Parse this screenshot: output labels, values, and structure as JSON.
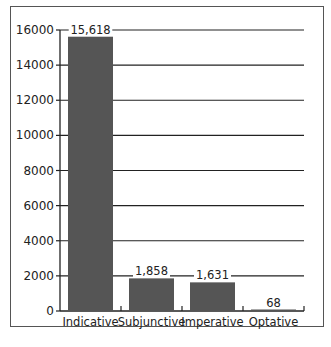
{
  "chart_data": {
    "type": "bar",
    "title": "",
    "xlabel": "",
    "ylabel": "",
    "categories": [
      "Indicative",
      "Subjunctive",
      "Imperative",
      "Optative"
    ],
    "values": [
      15618,
      1858,
      1631,
      68
    ],
    "value_labels": [
      "15,618",
      "1,858",
      "1,631",
      "68"
    ],
    "yticks": [
      0,
      2000,
      4000,
      6000,
      8000,
      10000,
      12000,
      14000,
      16000
    ],
    "ylim": [
      0,
      16000
    ],
    "grid": true,
    "legend": null,
    "bar_color": "#555555"
  }
}
